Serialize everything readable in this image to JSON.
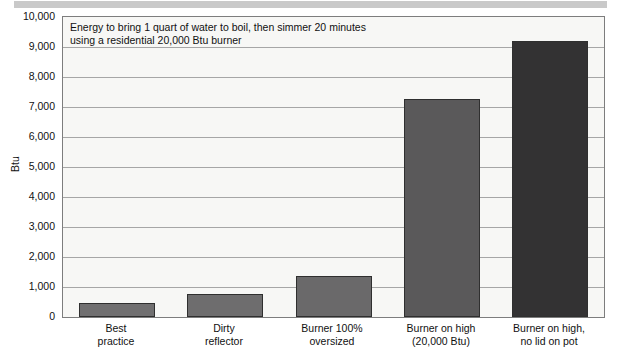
{
  "chart_data": {
    "type": "bar",
    "title": "Energy to bring 1 quart of water to boil, then simmer 20 minutes\nusing a residential 20,000 Btu burner",
    "xlabel": "",
    "ylabel": "Btu",
    "ylim": [
      0,
      10000
    ],
    "ytick_step": 1000,
    "grid": true,
    "legend": false,
    "categories": [
      "Best\npractice",
      "Dirty\nreflector",
      "Burner 100%\noversized",
      "Burner on high\n(20,000 Btu)",
      "Burner on high,\nno lid on pot"
    ],
    "values": [
      470,
      750,
      1380,
      7250,
      9200
    ],
    "ytick_labels": [
      "10,000",
      "9,000",
      "8,000",
      "7,000",
      "6,000",
      "5,000",
      "4,000",
      "3,000",
      "2,000",
      "1,000",
      "0"
    ],
    "ytick_values": [
      10000,
      9000,
      8000,
      7000,
      6000,
      5000,
      4000,
      3000,
      2000,
      1000,
      0
    ],
    "bar_colors": [
      "#706f70",
      "#6e6d6e",
      "#6a696a",
      "#5a595a",
      "#333233"
    ],
    "bar_edge_color": "#2f2f2f",
    "plot_background": "#f7f7f5",
    "grid_color": "#a6a6a6",
    "frame_color": "#7d7d7d",
    "top_band_color": "#c9c9c9",
    "text_color": "#111111"
  }
}
